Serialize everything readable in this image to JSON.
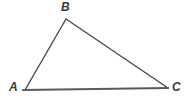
{
  "figure": {
    "kind": "geometry-diagram",
    "shape": "triangle",
    "background_color": "#ffffff",
    "stroke_color": "#4a4a4a",
    "base_stroke_color": "#5a5a5a",
    "label_color": "#3a3a3a",
    "width": 192,
    "height": 103
  },
  "labels": {
    "a": "A",
    "b": "B",
    "c": "C"
  },
  "chart_data": {
    "type": "scatter",
    "title": "",
    "xlabel": "",
    "ylabel": "",
    "grid": false,
    "legend": "none",
    "xlim": [
      0,
      192
    ],
    "ylim": [
      0,
      103
    ],
    "vertices": [
      {
        "name": "A",
        "x": 25,
        "y": 90
      },
      {
        "name": "B",
        "x": 66,
        "y": 19
      },
      {
        "name": "C",
        "x": 168,
        "y": 88
      }
    ],
    "edges": [
      {
        "name": "AB",
        "from": "A",
        "to": "B"
      },
      {
        "name": "BC",
        "from": "B",
        "to": "C"
      },
      {
        "name": "AC",
        "from": "A",
        "to": "C"
      }
    ],
    "annotations": [
      {
        "text": "A",
        "x": 13,
        "y": 88,
        "placement": "below-left-of-vertex"
      },
      {
        "text": "B",
        "x": 65,
        "y": 8,
        "placement": "above-vertex"
      },
      {
        "text": "C",
        "x": 176,
        "y": 88,
        "placement": "right-of-vertex"
      }
    ]
  }
}
